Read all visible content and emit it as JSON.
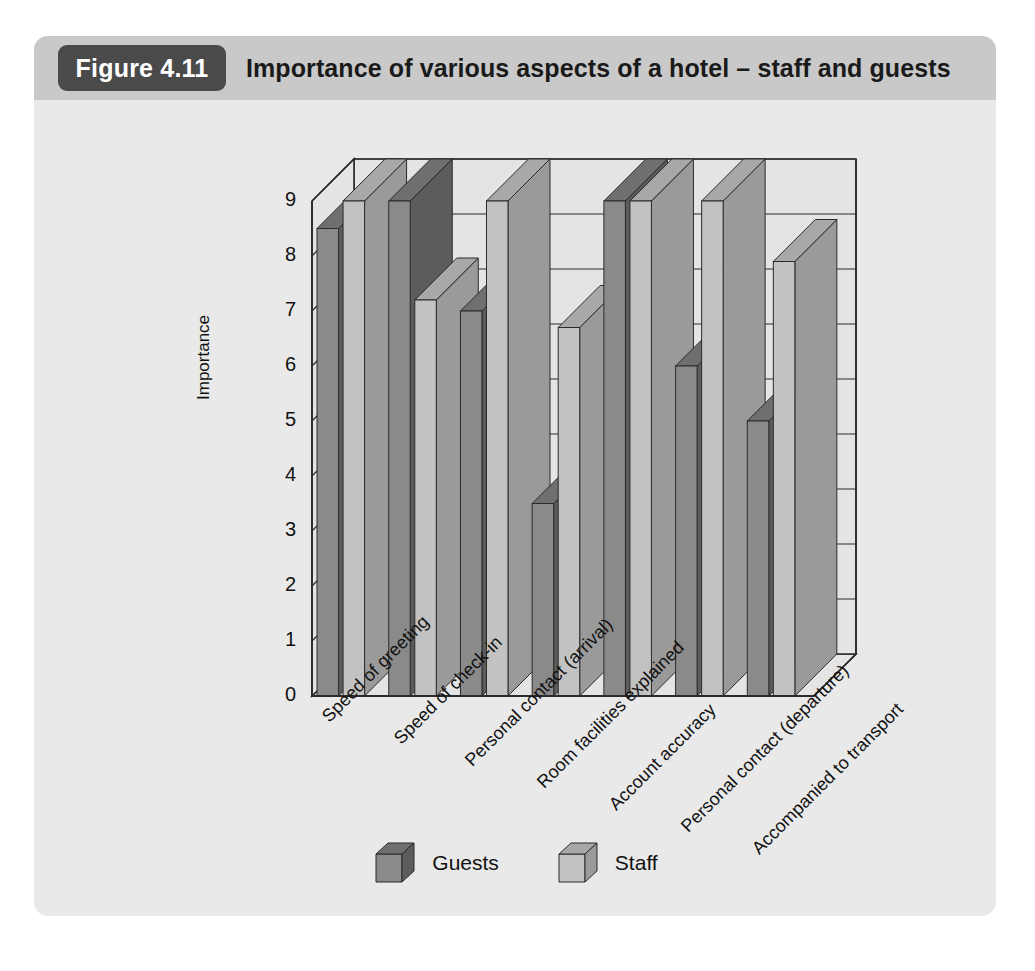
{
  "figure": {
    "tag": "Figure 4.11",
    "title": "Importance of various aspects of a hotel – staff and guests"
  },
  "colors": {
    "panel_background": "#e9e9e9",
    "header_background": "#c9c9c9",
    "tag_background": "#4a4a4a",
    "guests_front": "#8a8a8a",
    "guests_top": "#6f6f6f",
    "guests_side": "#5c5c5c",
    "staff_front": "#c2c2c2",
    "staff_top": "#a8a8a8",
    "staff_side": "#9a9a9a",
    "axis_line": "#2b2b2b",
    "plot_floor": "#e4e4e4"
  },
  "chart_data": {
    "type": "bar",
    "title": "Importance of various aspects of a hotel – staff and guests",
    "xlabel": "",
    "ylabel": "Importance",
    "ylim": [
      0,
      9
    ],
    "yticks": [
      0,
      1,
      2,
      3,
      4,
      5,
      6,
      7,
      8,
      9
    ],
    "grid": true,
    "legend_position": "bottom",
    "categories": [
      "Speed of greeting",
      "Speed of check-in",
      "Personal contact (arrival)",
      "Room facilities explained",
      "Account accuracy",
      "Personal contact (departure)",
      "Accompanied to transport"
    ],
    "series": [
      {
        "name": "Guests",
        "values": [
          8.5,
          9.0,
          7.0,
          3.5,
          9.0,
          6.0,
          5.0
        ]
      },
      {
        "name": "Staff",
        "values": [
          9.0,
          7.2,
          9.0,
          6.7,
          9.0,
          9.0,
          7.9
        ]
      }
    ]
  },
  "legend": [
    {
      "label": "Guests"
    },
    {
      "label": "Staff"
    }
  ]
}
